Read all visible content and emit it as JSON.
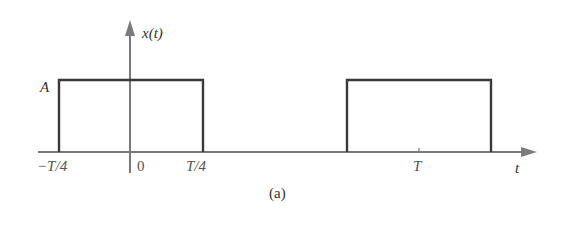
{
  "figure": {
    "caption": "(a)",
    "signal_label": "x(t)",
    "amplitude_label": "A",
    "time_axis_label": "t",
    "tick_labels": {
      "neg_quarter": "−T/4",
      "zero": "0",
      "pos_quarter": "T/4",
      "period": "T"
    },
    "colors": {
      "axis": "#7a7a7a",
      "pulse": "#3a3a3a",
      "background": "#ffffff"
    }
  },
  "signal": {
    "type": "periodic rectangular pulse train",
    "amplitude": "A",
    "period": "T",
    "pulses": [
      {
        "start": "-T/4",
        "end": "T/4",
        "height": "A"
      },
      {
        "start": "3T/4",
        "end": "5T/4",
        "height": "A"
      }
    ]
  }
}
